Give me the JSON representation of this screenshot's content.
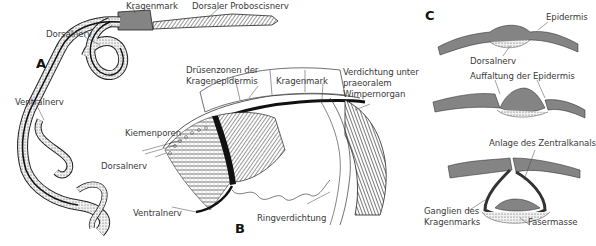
{
  "figure": {
    "panels": [
      {
        "id": "A",
        "label": "A"
      },
      {
        "id": "B",
        "label": "B"
      },
      {
        "id": "C",
        "label": "C"
      }
    ],
    "panel_a": {
      "kragenmark": "Kragenmark",
      "dorsaler_proboscisnerv": "Dorsaler Proboscisnerv",
      "dorsalnerv": "Dorsalnerv",
      "ventralnerv": "Ventralnerv"
    },
    "panel_b": {
      "druesenzonen_line1": "Drüsenzonen der",
      "druesenzonen_line2": "Kragenepidermis",
      "kragenmark": "Kragenmark",
      "verdichtung_line1": "Verdichtung unter",
      "verdichtung_line2": "praeoralem",
      "verdichtung_line3": "Wimpernorgan",
      "kiemenporen": "Kiemenporen",
      "dorsalnerv": "Dorsalnerv",
      "ventralnerv": "Ventralnerv",
      "ringverdichtung": "Ringverdichtung"
    },
    "panel_c": {
      "epidermis": "Epidermis",
      "dorsalnerv": "Dorsalnerv",
      "auffaltung": "Auffaltung der Epidermis",
      "anlage": "Anlage des Zentralkanals",
      "ganglien_line1": "Ganglien des",
      "ganglien_line2": "Kragenmarks",
      "fasermasse": "Fasermasse"
    }
  }
}
